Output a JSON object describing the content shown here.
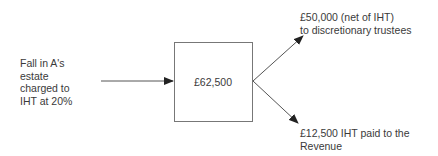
{
  "diagram": {
    "source_label": [
      "Fall in A's",
      "estate",
      "charged to",
      "IHT at 20%"
    ],
    "box_value": "£62,500",
    "outputs": [
      {
        "lines": [
          "£50,000 (net of IHT)",
          "to discretionary trustees"
        ]
      },
      {
        "lines": [
          "£12,500 IHT paid to the",
          "Revenue"
        ]
      }
    ],
    "colors": {
      "line": "#555555",
      "box_border": "#777777",
      "text": "#3a3a3a"
    }
  }
}
